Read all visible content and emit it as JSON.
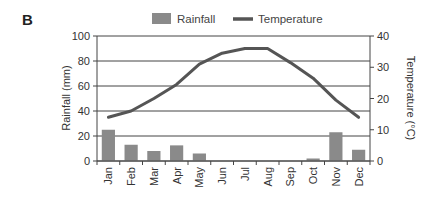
{
  "panel_label": "B",
  "legend": {
    "rainfall_label": "Rainfall",
    "temperature_label": "Temperature"
  },
  "axes": {
    "left_title": "Rainfall (mm)",
    "right_title": "Temperature (°C)",
    "left_ticks": [
      "0",
      "20",
      "40",
      "60",
      "80",
      "100"
    ],
    "right_ticks": [
      "0",
      "10",
      "20",
      "30",
      "40"
    ]
  },
  "colors": {
    "bar": "#8a8a8a",
    "line": "#555555",
    "grid": "#444444"
  },
  "chart_data": {
    "type": "bar+line",
    "title": "",
    "categories": [
      "Jan",
      "Feb",
      "Mar",
      "Apr",
      "May",
      "Jun",
      "Jul",
      "Aug",
      "Sep",
      "Oct",
      "Nov",
      "Dec"
    ],
    "series": [
      {
        "name": "Rainfall",
        "type": "bar",
        "axis": "left",
        "unit": "mm",
        "values": [
          25,
          13,
          8,
          12.5,
          6,
          0,
          0,
          0,
          0,
          2,
          23,
          9
        ]
      },
      {
        "name": "Temperature",
        "type": "line",
        "axis": "right",
        "unit": "°C",
        "values": [
          14,
          16,
          20,
          24.5,
          31,
          34.5,
          36,
          36,
          31.5,
          26.5,
          19.5,
          14
        ]
      }
    ],
    "xlabel": "",
    "ylabel": "Rainfall (mm)",
    "y2label": "Temperature (°C)",
    "ylim": [
      0,
      100
    ],
    "y2lim": [
      0,
      40
    ],
    "grid": true,
    "legend_position": "top"
  }
}
